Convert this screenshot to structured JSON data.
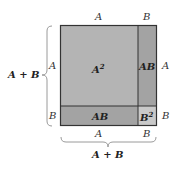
{
  "diagram": {
    "regions": [
      {
        "id": "a-squared",
        "label_base": "A",
        "label_sup": "2",
        "color": "#b4b4b4"
      },
      {
        "id": "ab-right",
        "label": "AB",
        "color": "#a3a3a3"
      },
      {
        "id": "ab-bottom",
        "label": "AB",
        "color": "#a3a3a3"
      },
      {
        "id": "b-squared",
        "label_base": "B",
        "label_sup": "2",
        "color": "#c9c9c9"
      }
    ],
    "top_labels": [
      "A",
      "B"
    ],
    "right_labels": [
      "A",
      "B"
    ],
    "left_labels": [
      "A",
      "B"
    ],
    "bottom_labels": [
      "A",
      "B"
    ],
    "left_brace_label": "A + B",
    "bottom_brace_label": "A + B",
    "border_color": "#333333",
    "brace_color": "#9a9a9a"
  }
}
